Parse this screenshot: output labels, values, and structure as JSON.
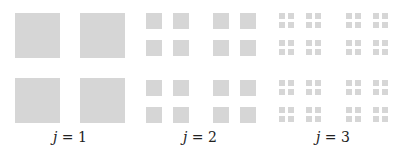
{
  "figure": {
    "fill_color": "#d6d6d6",
    "panels": [
      {
        "level": 1,
        "label_var": "j",
        "label_eq": " = 1",
        "label_center_x": 70,
        "origin_x": 15,
        "origin_y": 13,
        "size": 45,
        "grid": 2,
        "offsets": [
          0,
          65
        ]
      },
      {
        "level": 2,
        "label_var": "j",
        "label_eq": " = 2",
        "label_center_x": 200,
        "origin_x": 146,
        "origin_y": 13,
        "size": 16,
        "grid": 4,
        "offsets": [
          0,
          27,
          67,
          94
        ]
      },
      {
        "level": 3,
        "label_var": "j",
        "label_eq": " = 3",
        "label_center_x": 333,
        "origin_x": 279,
        "origin_y": 13,
        "size": 6,
        "grid": 8,
        "offsets": [
          0,
          9,
          27,
          36,
          67,
          76,
          94,
          103
        ]
      }
    ]
  }
}
